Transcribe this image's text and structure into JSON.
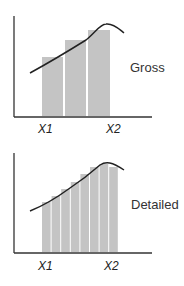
{
  "colors": {
    "bar": "#c4c4c4",
    "axis": "#333333",
    "curve": "#222222"
  },
  "panels": [
    {
      "label": "Gross",
      "x_ticks": [
        "X1",
        "X2"
      ],
      "bars": [
        {
          "x": 42,
          "w": 21,
          "top": 57
        },
        {
          "x": 65,
          "w": 21,
          "top": 40
        },
        {
          "x": 88,
          "w": 22,
          "top": 30
        }
      ]
    },
    {
      "label": "Detailed",
      "x_ticks": [
        "X1",
        "X2"
      ],
      "bars": [
        {
          "x": 42,
          "w": 8.6,
          "top": 59
        },
        {
          "x": 51.6,
          "w": 8.6,
          "top": 53
        },
        {
          "x": 61.2,
          "w": 8.6,
          "top": 46
        },
        {
          "x": 70.8,
          "w": 8.6,
          "top": 39
        },
        {
          "x": 80.4,
          "w": 8.6,
          "top": 31
        },
        {
          "x": 90,
          "w": 8.6,
          "top": 24
        },
        {
          "x": 99.6,
          "w": 8.6,
          "top": 21
        },
        {
          "x": 109.2,
          "w": 8.6,
          "top": 24
        }
      ]
    }
  ]
}
